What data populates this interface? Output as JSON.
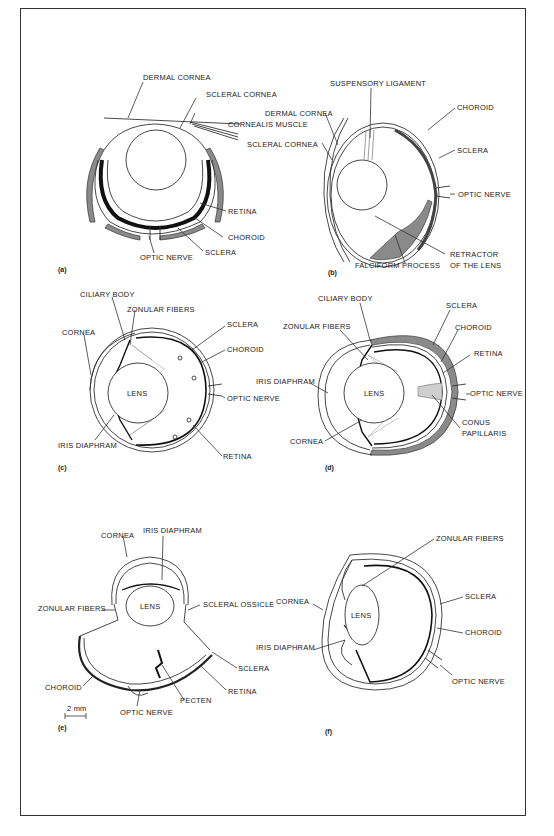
{
  "figure": {
    "panels": [
      {
        "id": "a",
        "panel_label": "(a)",
        "labels": [
          "DERMAL CORNEA",
          "SCLERAL CORNEA",
          "CORNEALIS MUSCLE",
          "RETINA",
          "CHOROID",
          "SCLERA",
          "OPTIC NERVE"
        ]
      },
      {
        "id": "b",
        "panel_label": "(b)",
        "labels": [
          "SUSPENSORY LIGAMENT",
          "DERMAL CORNEA",
          "CHOROID",
          "SCLERAL CORNEA",
          "SCLERA",
          "OPTIC NERVE",
          "FALCIFORM PROCESS",
          "RETRACTOR",
          "OF THE LENS"
        ]
      },
      {
        "id": "c",
        "panel_label": "(c)",
        "labels": [
          "CILIARY BODY",
          "ZONULAR FIBERS",
          "SCLERA",
          "CORNEA",
          "CHOROID",
          "LENS",
          "OPTIC NERVE",
          "IRIS DIAPHRAM",
          "RETINA"
        ]
      },
      {
        "id": "d",
        "panel_label": "(d)",
        "labels": [
          "CILIARY BODY",
          "SCLERA",
          "ZONULAR FIBERS",
          "CHOROID",
          "RETINA",
          "IRIS DIAPHRAM",
          "LENS",
          "OPTIC NERVE",
          "CORNEA",
          "CONUS",
          "PAPILLARIS"
        ]
      },
      {
        "id": "e",
        "panel_label": "(e)",
        "labels": [
          "CORNEA",
          "IRIS DIAPHRAM",
          "LENS",
          "ZONULAR FIBERS",
          "SCLERAL OSSICLE",
          "SCLERA",
          "CHOROID",
          "RETINA",
          "PECTEN",
          "OPTIC NERVE"
        ],
        "scale_bar": "2 mm"
      },
      {
        "id": "f",
        "panel_label": "(f)",
        "labels": [
          "ZONULAR FIBERS",
          "CORNEA",
          "SCLERA",
          "LENS",
          "IRIS DIAPHRAM",
          "CHOROID",
          "OPTIC NERVE"
        ]
      }
    ]
  }
}
